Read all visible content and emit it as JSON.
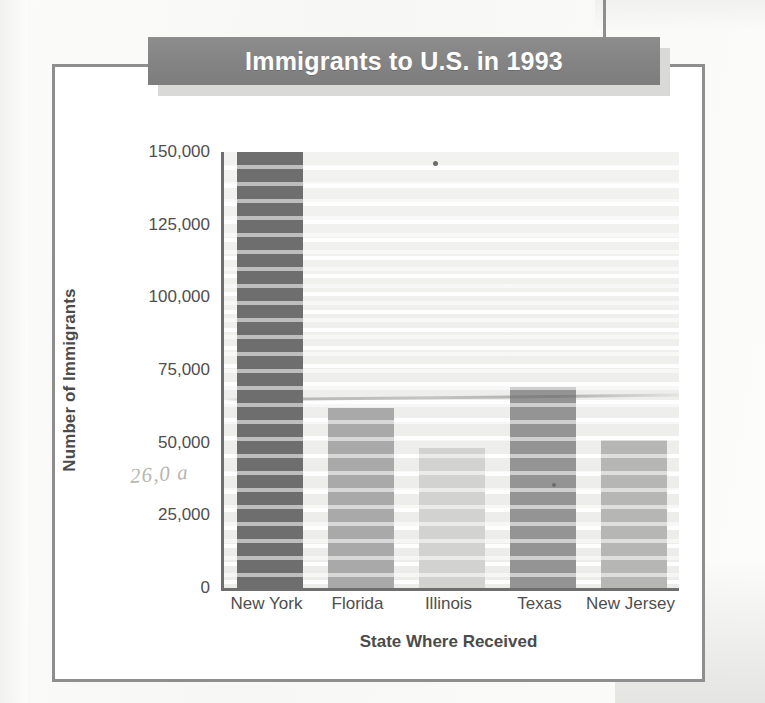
{
  "title": "Immigrants to U.S. in 1993",
  "annotation_handwritten": "26,0 a",
  "chart_data": {
    "type": "bar",
    "title": "Immigrants to U.S. in 1993",
    "xlabel": "State Where Received",
    "ylabel": "Number of Immigrants",
    "categories": [
      "New York",
      "Florida",
      "Illinois",
      "Texas",
      "New Jersey"
    ],
    "values": [
      150000,
      62000,
      48000,
      69000,
      51000
    ],
    "ylim": [
      0,
      150000
    ],
    "ytick_values": [
      0,
      25000,
      50000,
      75000,
      100000,
      125000,
      150000
    ],
    "ytick_labels": [
      "0",
      "25,000",
      "50,000",
      "75,000",
      "100,000",
      "125,000",
      "150,000"
    ],
    "grid": true,
    "legend": false,
    "bar_colors": [
      "#6e6e6e",
      "#a9a9a9",
      "#d2d2d0",
      "#949494",
      "#b6b6b4"
    ]
  },
  "colors": {
    "banner_background": "#848484",
    "banner_text": "#ffffff",
    "frame": "#8e8e8e",
    "axis": "#6f6f6f",
    "tick_text": "#4e4e4e",
    "plot_background": "#eeeeed"
  }
}
